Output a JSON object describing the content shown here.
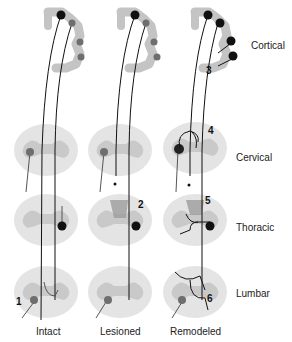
{
  "level_labels": {
    "cortical": "Cortical",
    "cervical": "Cervical",
    "thoracic": "Thoracic",
    "lumbar": "Lumbar"
  },
  "column_labels": {
    "intact": "Intact",
    "lesioned": "Lesioned",
    "remodeled": "Remodeled"
  },
  "annotations": {
    "n1": "1",
    "n2": "2",
    "n3": "3",
    "n4": "4",
    "n5": "5",
    "n6": "6"
  },
  "colors": {
    "tissue": "#e2e2e2",
    "grey_matter": "#c8c8c8",
    "cortex": "#c4c4c4",
    "neuron_grey": "#6e6e6e",
    "neuron_black": "#111111",
    "lesion": "#9a9a9a"
  }
}
